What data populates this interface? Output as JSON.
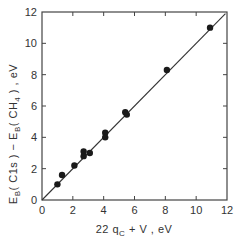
{
  "chart_data": {
    "type": "scatter",
    "title": "",
    "xlabel": "22 q_C + V, eV",
    "ylabel": "E_B(C1s) - E_B(CH4), eV",
    "xlabel_parts": {
      "pre": "22 q",
      "sub": "C",
      "post": " +  V ,  eV"
    },
    "ylabel_parts": {
      "a": "E",
      "a_sub": "B",
      "b": "( C1s )  − E",
      "b_sub": "B",
      "c": "( CH",
      "c_sub": "4",
      "d": " ) ,  eV"
    },
    "xlim": [
      0,
      12
    ],
    "ylim": [
      0,
      12
    ],
    "xticks": [
      0,
      2,
      4,
      6,
      8,
      10,
      12
    ],
    "yticks": [
      0,
      2,
      4,
      6,
      8,
      10,
      12
    ],
    "xtick_labels": [
      "0",
      "2",
      "4",
      "6",
      "8",
      "10",
      "12"
    ],
    "ytick_labels": [
      "0",
      "2",
      "4",
      "6",
      "8",
      "10",
      "12"
    ],
    "grid": false,
    "legend": null,
    "points": [
      {
        "x": 1.0,
        "y": 1.0
      },
      {
        "x": 1.3,
        "y": 1.6
      },
      {
        "x": 2.1,
        "y": 2.2
      },
      {
        "x": 2.7,
        "y": 3.1
      },
      {
        "x": 2.7,
        "y": 2.8
      },
      {
        "x": 3.1,
        "y": 3.0
      },
      {
        "x": 4.1,
        "y": 4.3
      },
      {
        "x": 4.1,
        "y": 4.0
      },
      {
        "x": 5.4,
        "y": 5.6
      },
      {
        "x": 5.5,
        "y": 5.45
      },
      {
        "x": 8.1,
        "y": 8.3
      },
      {
        "x": 10.9,
        "y": 11.0
      }
    ],
    "fit_line": {
      "x": [
        0,
        11.9
      ],
      "y": [
        0,
        11.9
      ],
      "description": "y = x reference line"
    }
  }
}
